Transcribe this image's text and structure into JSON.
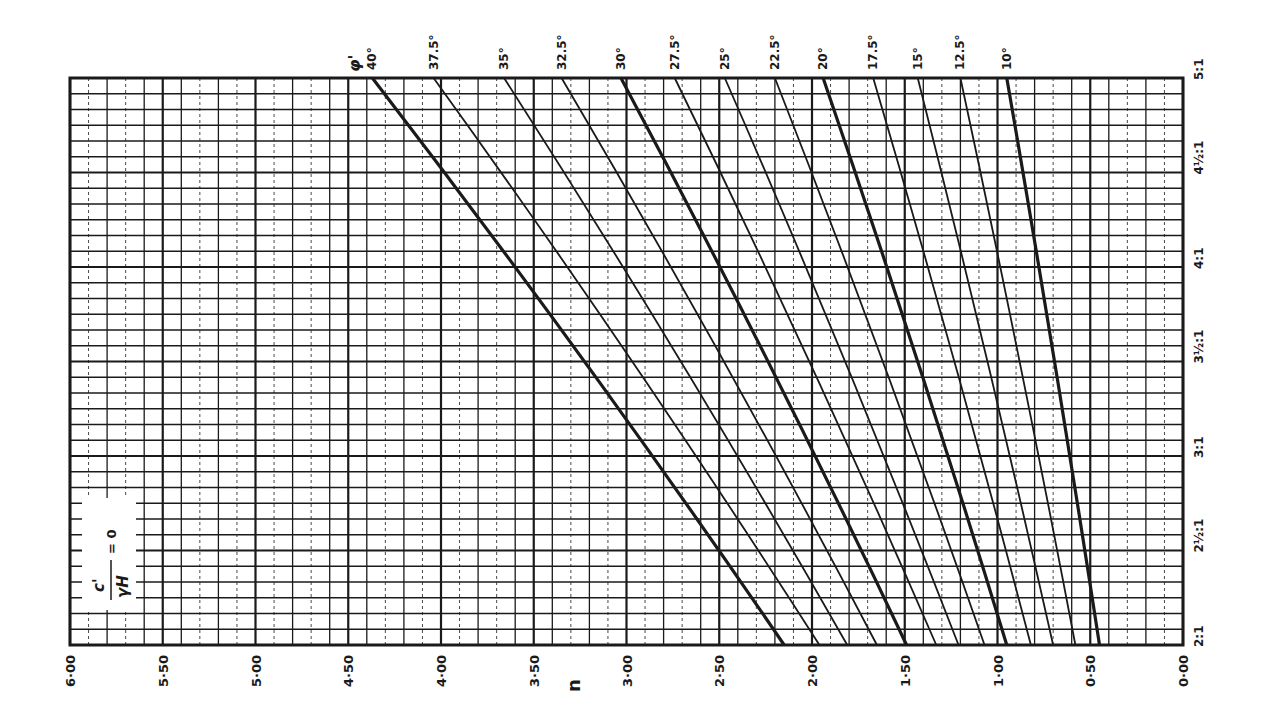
{
  "chart_data": {
    "type": "line",
    "title": "",
    "annotation": "c'/γH = 0",
    "xlabel": "n",
    "ylabel": "slope",
    "x_axis": {
      "ticks": [
        "6·00",
        "5·50",
        "5·00",
        "4·50",
        "4·00",
        "3·50",
        "3·00",
        "2·50",
        "2·00",
        "1·50",
        "1·00",
        "0·50",
        "0·00"
      ],
      "range": [
        6.0,
        0.0
      ],
      "reversed": true
    },
    "y_axis": {
      "ticks": [
        "2:1",
        "2½:1",
        "3:1",
        "3½:1",
        "4:1",
        "4½:1",
        "5:1"
      ],
      "range_ratio": [
        2.0,
        5.0
      ]
    },
    "legend_title": "φ'",
    "series": [
      {
        "name": "40°",
        "n_at_2to1": 2.15,
        "n_at_5to1": 4.37,
        "bold": true
      },
      {
        "name": "37.5°",
        "n_at_2to1": 1.96,
        "n_at_5to1": 4.04,
        "bold": false
      },
      {
        "name": "35°",
        "n_at_2to1": 1.81,
        "n_at_5to1": 3.66,
        "bold": false
      },
      {
        "name": "32.5°",
        "n_at_2to1": 1.65,
        "n_at_5to1": 3.35,
        "bold": false
      },
      {
        "name": "30°",
        "n_at_2to1": 1.49,
        "n_at_5to1": 3.03,
        "bold": true
      },
      {
        "name": "27.5°",
        "n_at_2to1": 1.33,
        "n_at_5to1": 2.74,
        "bold": false
      },
      {
        "name": "25°",
        "n_at_2to1": 1.21,
        "n_at_5to1": 2.47,
        "bold": false
      },
      {
        "name": "22.5°",
        "n_at_2to1": 1.07,
        "n_at_5to1": 2.2,
        "bold": false
      },
      {
        "name": "20°",
        "n_at_2to1": 0.95,
        "n_at_5to1": 1.94,
        "bold": true
      },
      {
        "name": "17.5°",
        "n_at_2to1": 0.82,
        "n_at_5to1": 1.67,
        "bold": false
      },
      {
        "name": "15°",
        "n_at_2to1": 0.7,
        "n_at_5to1": 1.43,
        "bold": false
      },
      {
        "name": "12.5°",
        "n_at_2to1": 0.58,
        "n_at_5to1": 1.2,
        "bold": false
      },
      {
        "name": "10°",
        "n_at_2to1": 0.45,
        "n_at_5to1": 0.95,
        "bold": true
      }
    ],
    "grid": true
  },
  "labels": {
    "x_title": "n",
    "phi_label": "φ'",
    "annotation_num": "c'",
    "annotation_den": "γH",
    "annotation_eq": "= 0"
  },
  "style": {
    "ink": "#1a1a1a",
    "background": "#ffffff"
  }
}
